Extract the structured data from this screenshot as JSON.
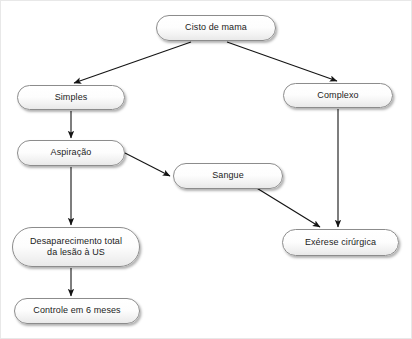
{
  "diagram": {
    "language": "pt-BR",
    "background_color": "#ffffff",
    "node_fill_color": "#f4f4f4",
    "node_border_color": "#8c8c8c",
    "edge_color": "#1a1a1a",
    "text_color": "#1b1b1b"
  },
  "nodes": {
    "root": {
      "label": "Cisto de mama",
      "x": 155,
      "y": 14,
      "w": 120,
      "h": 26
    },
    "simples": {
      "label": "Simples",
      "x": 16,
      "y": 84,
      "w": 108,
      "h": 25
    },
    "complexo": {
      "label": "Complexo",
      "x": 282,
      "y": 82,
      "w": 110,
      "h": 25
    },
    "aspiracao": {
      "label": "Aspiração",
      "x": 16,
      "y": 139,
      "w": 108,
      "h": 26
    },
    "sangue": {
      "label": "Sangue",
      "x": 172,
      "y": 162,
      "w": 110,
      "h": 26
    },
    "exerese": {
      "label": "Exérese cirúrgica",
      "x": 281,
      "y": 228,
      "w": 117,
      "h": 27
    },
    "desaparecimento": {
      "label": "Desaparecimento total\nda lesão à US",
      "x": 11,
      "y": 226,
      "w": 128,
      "h": 40
    },
    "controle": {
      "label": "Controle em 6 meses",
      "x": 13,
      "y": 297,
      "w": 126,
      "h": 26
    }
  },
  "edges": [
    {
      "name": "root-to-simples",
      "from": "root",
      "to": "simples",
      "path": "M 190 41 L 73 82",
      "arrow": true
    },
    {
      "name": "root-to-complexo",
      "from": "root",
      "to": "complexo",
      "path": "M 226 41 L 336 80",
      "arrow": true
    },
    {
      "name": "simples-to-aspiracao",
      "from": "simples",
      "to": "aspiracao",
      "path": "M 70 110 L 70 137",
      "arrow": true
    },
    {
      "name": "aspiracao-to-sangue",
      "from": "aspiracao",
      "to": "sangue",
      "path": "M 124 152 L 169 175",
      "arrow": true
    },
    {
      "name": "aspiracao-to-desaparecimento",
      "from": "aspiracao",
      "to": "desaparecimento",
      "path": "M 70 166 L 70 224",
      "arrow": true
    },
    {
      "name": "sangue-to-exerese",
      "from": "sangue",
      "to": "exerese",
      "path": "M 254 186 L 319 226",
      "arrow": true
    },
    {
      "name": "complexo-to-exerese",
      "from": "complexo",
      "to": "exerese",
      "path": "M 337 108 L 337 226",
      "arrow": true
    },
    {
      "name": "desaparecimento-to-controle",
      "from": "desaparecimento",
      "to": "controle",
      "path": "M 70 267 L 70 295",
      "arrow": true
    }
  ]
}
